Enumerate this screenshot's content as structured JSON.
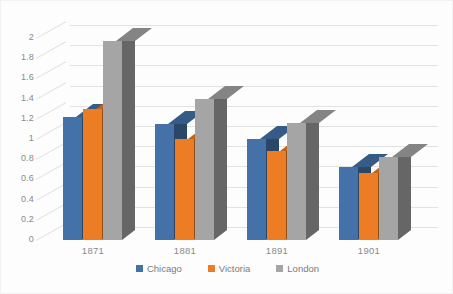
{
  "chart_data": {
    "type": "bar",
    "title": "",
    "subtitle": "",
    "xlabel": "",
    "ylabel": "",
    "categories": [
      "1871",
      "1881",
      "1891",
      "1901"
    ],
    "series": [
      {
        "name": "Chicago",
        "color": "#4472A8",
        "values": [
          1.22,
          1.15,
          1.0,
          0.72
        ]
      },
      {
        "name": "Victoria",
        "color": "#ED7D24",
        "values": [
          1.3,
          1.0,
          0.88,
          0.66
        ]
      },
      {
        "name": "London",
        "color": "#A5A5A5",
        "values": [
          1.97,
          1.4,
          1.16,
          0.82
        ]
      }
    ],
    "ylim": [
      0,
      2
    ],
    "ytick_step": 0.2,
    "ytick_labels": [
      "0",
      "0.2",
      "0.4",
      "0.6",
      "0.8",
      "1",
      "1.2",
      "1.4",
      "1.6",
      "1.8",
      "2"
    ],
    "grid": true,
    "grid_axis": "y",
    "legend_position": "bottom",
    "style": "3d-clustered-column",
    "background": "#ffffff",
    "grid_color": "#e2e2e2",
    "tick_label_color": "#8a8a8a"
  },
  "legend": {
    "entries": [
      {
        "label": "Chicago"
      },
      {
        "label": "Victoria"
      },
      {
        "label": "London"
      }
    ]
  }
}
